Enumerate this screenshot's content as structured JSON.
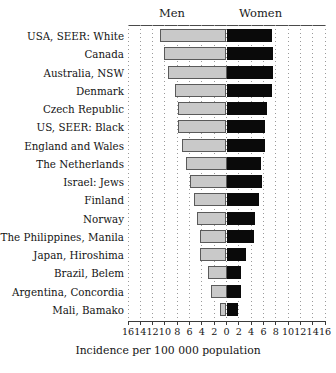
{
  "header": {
    "men_label": "Men",
    "women_label": "Women"
  },
  "axis": {
    "x_title": "Incidence per 100 000 population",
    "ticks": [
      "16",
      "14",
      "12",
      "10",
      "8",
      "6",
      "4",
      "2",
      "0",
      "2",
      "4",
      "6",
      "8",
      "10",
      "12",
      "14",
      "16"
    ],
    "tick_values": [
      -16,
      -14,
      -12,
      -10,
      -8,
      -6,
      -4,
      -2,
      0,
      2,
      4,
      6,
      8,
      10,
      12,
      14,
      16
    ],
    "x_min": -16,
    "x_max": 16
  },
  "colors": {
    "men_fill": "#c9c9c9",
    "men_stroke": "#5a5a5a",
    "women_fill": "#0a0a0a",
    "background": "#ffffff",
    "grid": "#9a9a9a",
    "axis": "#3a3a3a",
    "text": "#141414"
  },
  "chart_data": {
    "type": "bar",
    "title": "",
    "subtitle": "",
    "xlabel": "Incidence per 100 000 population",
    "ylabel": "",
    "orientation": "horizontal",
    "style": "back-to-back bidirectional (population-pyramid) bar chart",
    "xlim": [
      -16,
      16
    ],
    "grid": true,
    "legend_position": "top (column headings)",
    "categories": [
      "USA, SEER: White",
      "Canada",
      "Australia, NSW",
      "Denmark",
      "Czech Republic",
      "US, SEER: Black",
      "England and Wales",
      "The Netherlands",
      "Israel: Jews",
      "Finland",
      "Norway",
      "The Philippines, Manila",
      "Japan, Hiroshima",
      "Brazil, Belem",
      "Argentina, Concordia",
      "Mali, Bamako"
    ],
    "series": [
      {
        "name": "Men",
        "side": "left",
        "color": "#c9c9c9",
        "values": [
          10.8,
          10.2,
          9.5,
          8.3,
          7.8,
          7.8,
          7.2,
          6.5,
          6.0,
          5.3,
          4.8,
          4.3,
          4.3,
          3.0,
          2.5,
          1.1
        ]
      },
      {
        "name": "Women",
        "side": "right",
        "color": "#0a0a0a",
        "values": [
          7.4,
          7.5,
          7.5,
          7.4,
          6.5,
          6.3,
          6.3,
          5.6,
          5.7,
          5.3,
          4.6,
          4.5,
          3.1,
          2.3,
          2.3,
          1.9
        ]
      }
    ]
  }
}
